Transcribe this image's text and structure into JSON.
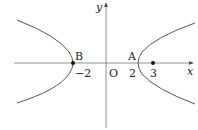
{
  "diagram": {
    "type": "hyperbola-on-coordinate-plane",
    "axes": {
      "x_label": "x",
      "y_label": "y",
      "origin_label": "O"
    },
    "tick_labels": {
      "neg_two": "−2",
      "two": "2",
      "three": "3"
    },
    "points": {
      "B": {
        "label": "B",
        "x": -2,
        "y": 0
      },
      "A": {
        "label": "A",
        "x": 2,
        "y": 0
      },
      "P3": {
        "x": 3,
        "y": 0
      }
    },
    "colors": {
      "curve": "#555555",
      "axis": "#666666",
      "point": "#111111"
    }
  }
}
